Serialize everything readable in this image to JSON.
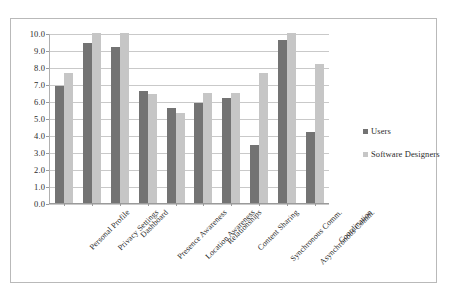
{
  "chart_data": {
    "type": "bar",
    "title": "",
    "subtitle": "",
    "xlabel": "",
    "ylabel": "",
    "ylim": [
      0.0,
      10.0
    ],
    "ytick_step": 1.0,
    "ytick_labels": [
      "10.0",
      "9.0",
      "8.0",
      "7.0",
      "6.0",
      "5.0",
      "4.0",
      "3.0",
      "2.0",
      "1.0",
      "0.0"
    ],
    "grid": true,
    "legend_position": "right",
    "orientation": "vertical",
    "grouping": "clustered",
    "categories": [
      "Personal Profile",
      "Privacy Settings",
      "Dashboard",
      "Presence Awareness",
      "Location Awareness",
      "Relationships",
      "Content Sharing",
      "Synchronous Comm.",
      "Asynchronous Comm.",
      "Coordination"
    ],
    "series": [
      {
        "name": "Users",
        "color": "#737373",
        "values": [
          6.9,
          9.4,
          9.15,
          6.6,
          5.6,
          5.9,
          6.2,
          3.4,
          9.6,
          4.15
        ]
      },
      {
        "name": "Software Designers",
        "color": "#c6c6c6",
        "values": [
          7.65,
          10.0,
          10.0,
          6.4,
          5.3,
          6.45,
          6.45,
          7.65,
          10.0,
          8.2
        ]
      }
    ]
  },
  "legend": {
    "entries": [
      {
        "label": "Users",
        "swatch": "legend-swatch-users"
      },
      {
        "label": "Software Designers",
        "swatch": "legend-swatch-software-designers"
      }
    ]
  }
}
